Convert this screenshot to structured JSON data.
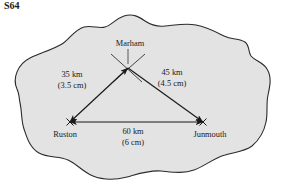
{
  "question_label": "S64",
  "figure": {
    "type": "scale-drawing-triangle-on-island",
    "island_fill": "#e3e3e3",
    "island_stroke": "#2b2b2b",
    "line_color": "#1a1a1a",
    "vertices": [
      {
        "key": "marham",
        "label": "Marham",
        "x": 128,
        "y": 68
      },
      {
        "key": "ruston",
        "label": "Ruston",
        "x": 70,
        "y": 122
      },
      {
        "key": "junmouth",
        "label": "Junmouth",
        "x": 203,
        "y": 122
      }
    ],
    "vertex_labels": [
      {
        "key": "marham-label",
        "text": "Marham",
        "x": 130,
        "y": 46
      },
      {
        "key": "ruston-label",
        "text": "Ruston",
        "x": 65,
        "y": 137
      },
      {
        "key": "junmouth-label",
        "text": "Junmouth",
        "x": 210,
        "y": 137
      }
    ],
    "side_labels": [
      {
        "key": "ruston-marham",
        "distance": "35 km",
        "scale_length": "(3.5 cm)",
        "x": 72,
        "y": 77
      },
      {
        "key": "marham-junmouth",
        "distance": "45 km",
        "scale_length": "(4.5 cm)",
        "x": 172,
        "y": 75
      },
      {
        "key": "ruston-junmouth",
        "distance": "60 km",
        "scale_length": "(6 cm)",
        "x": 133,
        "y": 134
      }
    ],
    "construction_arcs": [
      {
        "key": "arc-from-ruston",
        "d": "M 111 54 L 142 82"
      },
      {
        "key": "arc-from-junmouth",
        "d": "M 145 54 L 113 82"
      }
    ],
    "island_path": "M 17 89 C 12 78 18 64 30 58 C 40 53 52 50 62 44 C 70 39 74 30 84 27 C 92 25 99 29 105 27 C 112 25 115 19 124 16 C 133 13 139 17 145 21 C 151 25 157 27 165 26 C 176 25 186 23 196 25 C 207 27 216 32 224 36 C 232 40 239 38 245 42 C 250 46 248 52 251 56 C 255 61 263 62 267 69 C 272 77 270 86 268 95 C 266 104 268 113 266 122 C 264 132 259 140 252 146 C 244 152 234 152 225 155 C 214 158 205 166 194 170 C 183 174 172 172 161 171 C 149 170 138 174 127 177 C 115 180 103 180 93 176 C 83 172 77 164 68 160 C 59 156 48 158 39 153 C 30 148 27 138 24 129 C 21 120 22 111 20 103 C 19 97 19 93 17 89 Z"
  }
}
